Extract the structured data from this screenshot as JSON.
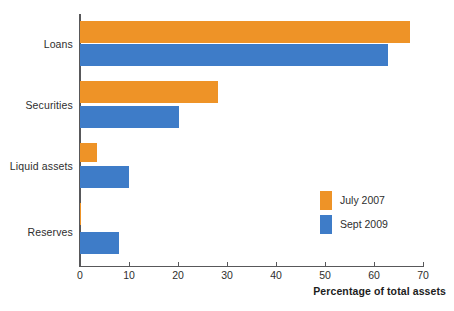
{
  "chart_data": {
    "type": "bar",
    "orientation": "horizontal",
    "title": "",
    "subtitle": "",
    "xlabel": "Percentage of total assets",
    "ylabel": "",
    "xlim": [
      0,
      70
    ],
    "xticks": [
      0,
      10,
      20,
      30,
      40,
      50,
      60,
      70
    ],
    "xtick_labels": [
      "0",
      "10",
      "20",
      "30",
      "40",
      "50",
      "60",
      "70"
    ],
    "grid": false,
    "legend_position": "inside-right",
    "categories": [
      "Loans",
      "Securities",
      "Liquid assets",
      "Reserves"
    ],
    "series": [
      {
        "name": "July 2007",
        "color": "#ee9327",
        "values": [
          67,
          28,
          3.5,
          0.3
        ]
      },
      {
        "name": "Sept 2009",
        "color": "#3e7cc8",
        "values": [
          62.5,
          20,
          10,
          8
        ]
      }
    ],
    "annotations": []
  },
  "legend": {
    "items": [
      {
        "label": "July 2007",
        "swatch": "legend-swatch-july"
      },
      {
        "label": "Sept 2009",
        "swatch": "legend-swatch-sept"
      }
    ]
  },
  "colors": {
    "july": "#ee9327",
    "sept": "#3e7cc8",
    "axis": "#58585a",
    "text": "#2e2e2e",
    "background": "#ffffff"
  }
}
